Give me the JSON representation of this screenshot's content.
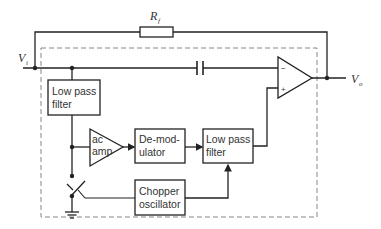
{
  "diagram": {
    "type": "circuit-block-diagram",
    "colors": {
      "line": "#222222",
      "dashed": "#888888",
      "text": "#333333",
      "background": "#ffffff"
    },
    "labels": {
      "feedback_resistor": "R",
      "feedback_resistor_sub": "f",
      "input": "V",
      "input_sub": "i",
      "output": "V",
      "output_sub": "o",
      "opamp_minus": "−",
      "opamp_plus": "+"
    },
    "blocks": {
      "lpf_input": {
        "line1": "Low pass",
        "line2": "filter"
      },
      "ac_amp": {
        "line1": "ac",
        "line2": "amp"
      },
      "demodulator": {
        "line1": "De-mod-",
        "line2": "ulator"
      },
      "lpf_output": {
        "line1": "Low pass",
        "line2": "filter"
      },
      "chopper_oscillator": {
        "line1": "Chopper",
        "line2": "oscillator"
      }
    },
    "components": [
      "feedback-resistor",
      "coupling-capacitor",
      "op-amp",
      "chopper-switch",
      "ground"
    ]
  }
}
